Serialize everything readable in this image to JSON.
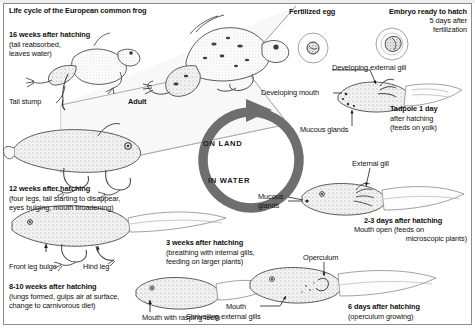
{
  "figure": {
    "title": "Life cycle of the European common frog",
    "ring": {
      "on_land": "ON LAND",
      "in_water": "IN WATER"
    }
  },
  "stages": {
    "adult": {
      "label": "Adult"
    },
    "sixteen_weeks": {
      "heading": "16 weeks after hatching",
      "detail_line1": "(tail reabsorbed,",
      "detail_line2": "leaves water)",
      "callout": "Tail stump"
    },
    "twelve_weeks": {
      "heading": "12 weeks after hatching",
      "detail_line1": "(four legs, tail starting to disappear,",
      "detail_line2": "eyes bulging, mouth broadening)"
    },
    "eight_to_ten_weeks": {
      "heading": "8-10 weeks after hatching",
      "detail_line1": "(lungs formed, gulps air at surface,",
      "detail_line2": "change to carnivorous diet)",
      "callout_front": "Front leg bulge",
      "callout_hind": "Hind leg"
    },
    "three_weeks": {
      "heading": "3 weeks after hatching",
      "detail_line1": "(breathing with internal gills,",
      "detail_line2": "feeding on larger plants)",
      "callout_mouth": "Mouth with rasping teeth"
    },
    "six_days": {
      "heading": "6 days after hatching",
      "detail": "(operculum growing)",
      "callout_operculum": "Operculum",
      "callout_mouth": "Mouth",
      "callout_gills": "Shrivelling external gills"
    },
    "two_to_three_days": {
      "heading": "2-3 days after hatching",
      "detail_line1": "Mouth open (feeds on",
      "detail_line2": "microscopic plants)",
      "callout_gill": "External gill",
      "callout_mucous_line1": "Mucous",
      "callout_mucous_line2": "glands"
    },
    "one_day": {
      "heading": "Tadpole 1 day",
      "detail_line1": "after hatching",
      "detail_line2": "(feeds on yolk)",
      "callout_gill": "Developing external gill",
      "callout_mouth": "Developing mouth",
      "callout_mucous": "Mucous glands"
    },
    "fertilized_egg": {
      "heading": "Fertilized egg"
    },
    "embryo": {
      "heading_line1": "Embryo ready to hatch",
      "heading_line2": "5 days after",
      "heading_line3": "fertilization"
    }
  },
  "colors": {
    "ink": "#111111",
    "ring": "#6e6e6e",
    "frame": "#8b8b8b",
    "paper": "#ffffff"
  }
}
